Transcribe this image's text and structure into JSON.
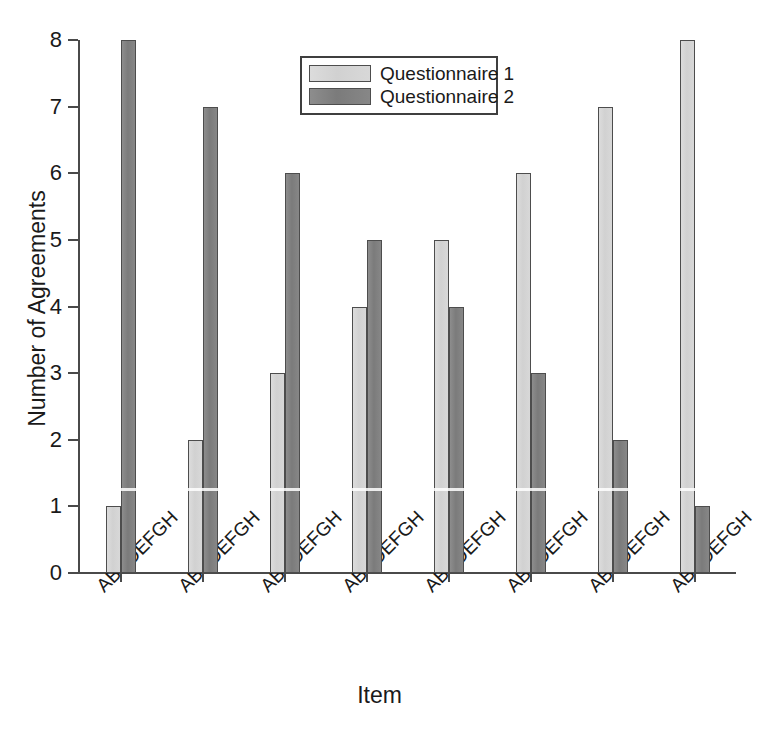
{
  "scan_artifacts": {
    "top_fragment_left": "",
    "top_fragment_right": ""
  },
  "chart_data": {
    "type": "bar",
    "title": "",
    "subtitle": "",
    "xlabel": "Item",
    "ylabel": "Number of Agreements",
    "categories": [
      "ABCDEFGH",
      "ABCDEFGH",
      "ABCDEFGH",
      "ABCDEFGH",
      "ABCDEFGH",
      "ABCDEFGH",
      "ABCDEFGH",
      "ABCDEFGH"
    ],
    "series": [
      {
        "name": "Questionnaire 1",
        "color": "#d6d6d6",
        "values": [
          1,
          2,
          3,
          4,
          5,
          6,
          7,
          8
        ]
      },
      {
        "name": "Questionnaire 2",
        "color": "#848484",
        "values": [
          8,
          7,
          6,
          5,
          4,
          3,
          2,
          1
        ]
      }
    ],
    "ylim": [
      0,
      8
    ],
    "ytick_labels": [
      "0",
      "1",
      "2",
      "3",
      "4",
      "5",
      "6",
      "7",
      "8"
    ],
    "ytick_values": [
      0,
      1,
      2,
      3,
      4,
      5,
      6,
      7,
      8
    ],
    "grid": false,
    "legend_position": "top-center",
    "bar_edge_color": "#4d4d4d",
    "axis_color": "#4a4a4a",
    "xtick_label_rotation": -45
  }
}
